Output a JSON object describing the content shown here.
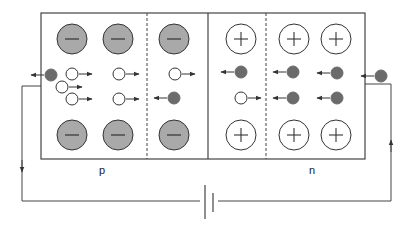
{
  "diagram": {
    "labels": {
      "p_region": "p",
      "n_region": "n"
    },
    "colors": {
      "stroke": "#333333",
      "acceptor_fill": "#a9a9a9",
      "electron_fill": "#6b6b6b",
      "hole_fill": "#ffffff",
      "donor_fill": "#ffffff"
    },
    "regions": [
      {
        "name": "p-neutral",
        "x1": 41,
        "x2": 147
      },
      {
        "name": "p-depletion",
        "x1": 147,
        "x2": 208
      },
      {
        "name": "n-depletion",
        "x1": 208,
        "x2": 266
      },
      {
        "name": "n-neutral",
        "x1": 266,
        "x2": 365
      }
    ],
    "acceptor_ions": [
      {
        "x": 72,
        "y": 39,
        "symbol": "−"
      },
      {
        "x": 118,
        "y": 39,
        "symbol": "−"
      },
      {
        "x": 174,
        "y": 39,
        "symbol": "−"
      },
      {
        "x": 72,
        "y": 135,
        "symbol": "−"
      },
      {
        "x": 118,
        "y": 135,
        "symbol": "−"
      },
      {
        "x": 174,
        "y": 135,
        "symbol": "−"
      }
    ],
    "donor_ions": [
      {
        "x": 241,
        "y": 39,
        "symbol": "+"
      },
      {
        "x": 294,
        "y": 39,
        "symbol": "+"
      },
      {
        "x": 336,
        "y": 39,
        "symbol": "+"
      },
      {
        "x": 241,
        "y": 135,
        "symbol": "+"
      },
      {
        "x": 294,
        "y": 135,
        "symbol": "+"
      },
      {
        "x": 336,
        "y": 135,
        "symbol": "+"
      }
    ],
    "carriers": [
      {
        "type": "electron",
        "x": 51,
        "y": 75,
        "direction": "left"
      },
      {
        "type": "hole",
        "x": 72,
        "y": 74,
        "direction": "right"
      },
      {
        "type": "hole",
        "x": 62,
        "y": 87,
        "direction": "right"
      },
      {
        "type": "hole",
        "x": 72,
        "y": 99,
        "direction": "right"
      },
      {
        "type": "hole",
        "x": 119,
        "y": 74,
        "direction": "right"
      },
      {
        "type": "hole",
        "x": 119,
        "y": 99,
        "direction": "right"
      },
      {
        "type": "hole",
        "x": 175,
        "y": 74,
        "direction": "right"
      },
      {
        "type": "electron",
        "x": 174,
        "y": 98,
        "direction": "left"
      },
      {
        "type": "electron",
        "x": 241,
        "y": 72,
        "direction": "left"
      },
      {
        "type": "hole",
        "x": 241,
        "y": 98,
        "direction": "right"
      },
      {
        "type": "electron",
        "x": 293,
        "y": 72,
        "direction": "left"
      },
      {
        "type": "electron",
        "x": 293,
        "y": 98,
        "direction": "left"
      },
      {
        "type": "electron",
        "x": 337,
        "y": 73,
        "direction": "left"
      },
      {
        "type": "electron",
        "x": 337,
        "y": 98,
        "direction": "left"
      },
      {
        "type": "electron",
        "x": 381,
        "y": 76,
        "direction": "left"
      }
    ],
    "circuit": {
      "battery": "DC source",
      "current_direction_left": "down",
      "current_direction_right": "up"
    }
  }
}
